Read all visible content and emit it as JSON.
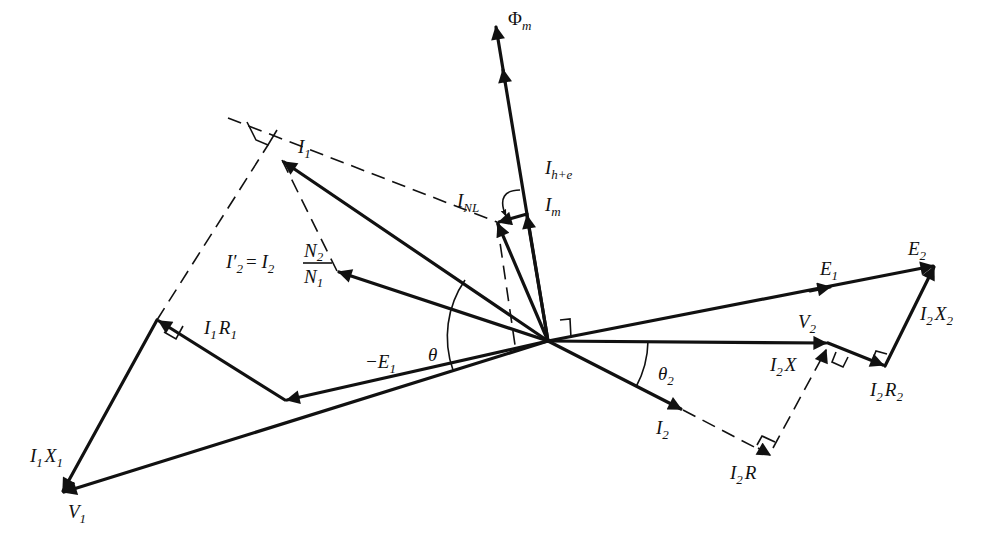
{
  "figure": {
    "type": "phasor-diagram"
  },
  "labels": {
    "phi_m": {
      "main": "Φ",
      "sub": "m"
    },
    "i1": {
      "main": "I",
      "sub": "1"
    },
    "i_he": {
      "main": "I",
      "sub": "h+e"
    },
    "i_nl": {
      "main": "I",
      "sub": "NL"
    },
    "i_m": {
      "main": "I",
      "sub": "m"
    },
    "i2_prime": {
      "lhs": "I′",
      "lhs_sub": "2",
      "eq": "= I",
      "eq_sub": "2",
      "num": "N",
      "num_sub": "2",
      "den": "N",
      "den_sub": "1"
    },
    "i1r1": {
      "a": "I",
      "a_sub": "1",
      "b": "R",
      "b_sub": "1"
    },
    "theta": "θ",
    "neg_e1": {
      "main": "−E",
      "sub": "1"
    },
    "i1x1": {
      "a": "I",
      "a_sub": "1",
      "b": "X",
      "b_sub": "1"
    },
    "v1": {
      "main": "V",
      "sub": "1"
    },
    "e1": {
      "main": "E",
      "sub": "1"
    },
    "e2": {
      "main": "E",
      "sub": "2"
    },
    "i2x2": {
      "a": "I",
      "a_sub": "2",
      "b": "X",
      "b_sub": "2"
    },
    "v2": {
      "main": "V",
      "sub": "2"
    },
    "i2x": {
      "a": "I",
      "a_sub": "2",
      "b": "X"
    },
    "theta2": {
      "main": "θ",
      "sub": "2"
    },
    "i2r2": {
      "a": "I",
      "a_sub": "2",
      "b": "R",
      "b_sub": "2"
    },
    "i2": {
      "main": "I",
      "sub": "2"
    },
    "i2r": {
      "a": "I",
      "a_sub": "2",
      "b": "R"
    }
  },
  "vectors": [
    {
      "name": "Phi_m",
      "from": [
        548,
        341
      ],
      "to": [
        496,
        25
      ]
    },
    {
      "name": "I_m",
      "from": [
        548,
        341
      ],
      "to": [
        527,
        214
      ]
    },
    {
      "name": "I_h+e",
      "from": [
        527,
        214
      ],
      "to": [
        497,
        222
      ]
    },
    {
      "name": "I_NL",
      "from": [
        548,
        341
      ],
      "to": [
        497,
        222
      ]
    },
    {
      "name": "I1",
      "from": [
        548,
        341
      ],
      "to": [
        282,
        160
      ]
    },
    {
      "name": "I'2",
      "from": [
        548,
        341
      ],
      "to": [
        337,
        271
      ]
    },
    {
      "name": "-E1",
      "from": [
        548,
        341
      ],
      "to": [
        285,
        400
      ]
    },
    {
      "name": "I1R1",
      "from": [
        285,
        400
      ],
      "to": [
        157,
        320
      ]
    },
    {
      "name": "I1X1",
      "from": [
        157,
        320
      ],
      "to": [
        62,
        493
      ]
    },
    {
      "name": "V1",
      "from": [
        548,
        341
      ],
      "to": [
        62,
        493
      ]
    },
    {
      "name": "E1",
      "from": [
        548,
        341
      ],
      "to": [
        935,
        265
      ]
    },
    {
      "name": "V2",
      "from": [
        548,
        341
      ],
      "to": [
        828,
        343
      ]
    },
    {
      "name": "I2R2",
      "from": [
        828,
        343
      ],
      "to": [
        885,
        366
      ]
    },
    {
      "name": "I2X2",
      "from": [
        885,
        366
      ],
      "to": [
        935,
        265
      ]
    },
    {
      "name": "I2",
      "from": [
        548,
        341
      ],
      "to": [
        683,
        410
      ]
    },
    {
      "name": "I2R",
      "from": [
        683,
        410
      ],
      "to": [
        770,
        455
      ]
    },
    {
      "name": "I2X",
      "from": [
        770,
        455
      ],
      "to": [
        828,
        343
      ]
    }
  ]
}
